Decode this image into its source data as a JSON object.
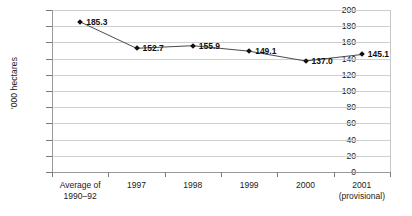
{
  "chart_data": {
    "type": "line",
    "title": "",
    "xlabel": "",
    "ylabel": "'000 hectares",
    "ylim": [
      0,
      200
    ],
    "ytick_step": 20,
    "yticks": [
      200,
      180,
      160,
      140,
      120,
      100,
      80,
      60,
      40,
      20,
      0
    ],
    "grid": true,
    "legend": "none",
    "categories": [
      "Average of 1990–92",
      "1997",
      "1998",
      "1999",
      "2000",
      "2001 (provisional)"
    ],
    "category_lines": [
      [
        "Average of",
        "1990–92"
      ],
      [
        "1997",
        ""
      ],
      [
        "1998",
        ""
      ],
      [
        "1999",
        ""
      ],
      [
        "2000",
        ""
      ],
      [
        "2001",
        "(provisional)"
      ]
    ],
    "values": [
      185.3,
      152.7,
      155.9,
      149.1,
      137.0,
      145.1
    ],
    "point_labels": [
      "185.3",
      "152.7",
      "155.9",
      "149.1",
      "137.0",
      "145.1"
    ],
    "marker": "diamond",
    "colors": {
      "line": "#4a4a4a",
      "marker": "#101010",
      "gridline": "#cfcfcf",
      "axis": "#9a9a9a",
      "text": "#1a1a1a",
      "background": "#ffffff"
    }
  }
}
